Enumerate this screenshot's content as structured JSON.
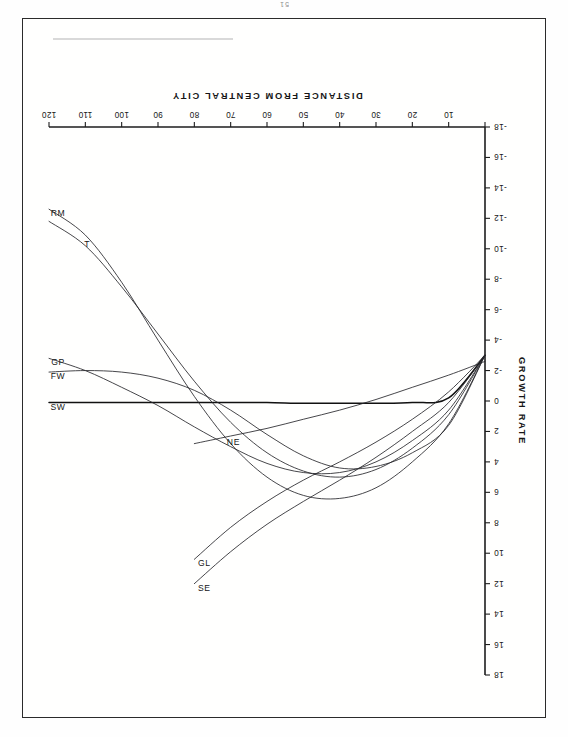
{
  "page": {
    "page_number": "51",
    "orientation_note": "rotated-180"
  },
  "chart_data": {
    "type": "line",
    "title": "",
    "xlabel": "DISTANCE FROM CENTRAL CITY",
    "ylabel": "GROWTH RATE",
    "xlim": [
      0,
      120
    ],
    "ylim": [
      -18,
      18
    ],
    "xticks": [
      0,
      10,
      20,
      30,
      40,
      50,
      60,
      70,
      80,
      90,
      100,
      110,
      120
    ],
    "xticklabels": [
      "",
      "10",
      "20",
      "30",
      "40",
      "50",
      "60",
      "70",
      "80",
      "90",
      "100",
      "110",
      "120"
    ],
    "yticks": [
      -18,
      -16,
      -14,
      -12,
      -10,
      -8,
      -6,
      -4,
      -2,
      0,
      2,
      4,
      6,
      8,
      10,
      12,
      14,
      16,
      18
    ],
    "yticklabels": [
      "-18",
      "-16",
      "-14",
      "-12",
      "-10",
      "-8",
      "-6",
      "-4",
      "-2",
      "0",
      "2",
      "4",
      "6",
      "8",
      "10",
      "12",
      "14",
      "16",
      "18"
    ],
    "grid": false,
    "legend": "inline-end-labels",
    "x": [
      0,
      10,
      20,
      30,
      40,
      50,
      60,
      70,
      80,
      90,
      100,
      110,
      120
    ],
    "series": [
      {
        "name": "SW",
        "label": "SW",
        "values": [
          -3.0,
          -0.2,
          0.1,
          0.15,
          0.15,
          0.15,
          0.1,
          0.1,
          0.1,
          0.1,
          0.1,
          0.1,
          0.1
        ]
      },
      {
        "name": "FW",
        "label": "FW",
        "values": [
          -3.0,
          1.6,
          3.4,
          4.3,
          4.4,
          3.6,
          2.2,
          0.6,
          -0.7,
          -1.5,
          -1.9,
          -2.0,
          -1.9
        ]
      },
      {
        "name": "GP",
        "label": "GP",
        "values": [
          -3.0,
          0.6,
          2.6,
          4.0,
          4.7,
          4.7,
          4.1,
          3.0,
          1.7,
          0.3,
          -0.9,
          -2.0,
          -2.8
        ]
      },
      {
        "name": "T",
        "label": "T",
        "values": [
          -3.0,
          0.9,
          3.1,
          4.5,
          5.0,
          4.6,
          3.4,
          1.4,
          -1.3,
          -4.4,
          -7.5,
          -10.2,
          -11.8
        ]
      },
      {
        "name": "RM",
        "label": "RM",
        "values": [
          -3.0,
          1.5,
          4.0,
          5.7,
          6.4,
          6.2,
          5.0,
          2.8,
          -0.3,
          -4.0,
          -7.8,
          -10.9,
          -12.6
        ]
      },
      {
        "name": "NE",
        "label": "NE",
        "values": [
          -2.6,
          -1.7,
          -0.9,
          -0.1,
          0.6,
          1.2,
          1.8,
          2.3,
          2.8,
          null,
          null,
          null,
          null
        ]
      },
      {
        "name": "SE",
        "label": "SE",
        "values": [
          -3.0,
          0.1,
          2.0,
          3.7,
          5.2,
          6.6,
          8.1,
          9.9,
          12.0,
          null,
          null,
          null,
          null
        ]
      },
      {
        "name": "GL",
        "label": "GL",
        "values": [
          -3.0,
          -0.6,
          1.2,
          2.7,
          4.0,
          5.2,
          6.6,
          8.3,
          10.4,
          null,
          null,
          null,
          null
        ]
      }
    ],
    "annotations": [
      {
        "text": "SW",
        "x": 120,
        "y": 0.1
      },
      {
        "text": "FW",
        "x": 120,
        "y": -1.9
      },
      {
        "text": "GP",
        "x": 120,
        "y": -2.8
      },
      {
        "text": "T",
        "x": 112,
        "y": -10.6
      },
      {
        "text": "RM",
        "x": 120,
        "y": -12.6
      },
      {
        "text": "NE",
        "x": 72,
        "y": 2.4
      },
      {
        "text": "SE",
        "x": 80,
        "y": 12.0
      },
      {
        "text": "GL",
        "x": 80,
        "y": 10.4
      }
    ]
  }
}
